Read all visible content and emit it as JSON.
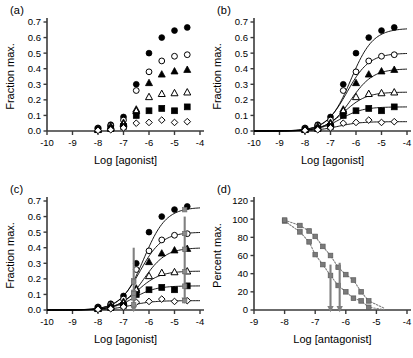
{
  "figure": {
    "panels": [
      "a",
      "b",
      "c",
      "d"
    ]
  },
  "panel_a": {
    "label": "(a)",
    "chart_data": {
      "type": "scatter",
      "title": "",
      "xlabel": "Log [agonist]",
      "ylabel": "Fraction max.",
      "xlim": [
        -10,
        -4
      ],
      "ylim": [
        0.0,
        0.7
      ],
      "xticks": [
        -10,
        -9,
        -8,
        -7,
        -6,
        -5,
        -4
      ],
      "xticklabels": [
        "-10",
        "-9",
        "-8",
        "-7",
        "-6",
        "-5",
        "-4"
      ],
      "yticks": [
        0.0,
        0.1,
        0.2,
        0.3,
        0.4,
        0.5,
        0.6,
        0.7
      ],
      "yticklabels": [
        "0.0",
        "0.1",
        "0.2",
        "0.3",
        "0.4",
        "0.5",
        "0.6",
        "0.7"
      ],
      "grid": false,
      "legend": "none",
      "x": [
        -8.0,
        -7.5,
        -7.0,
        -6.5,
        -6.0,
        -5.5,
        -5.0,
        -4.5
      ],
      "series": [
        {
          "name": "filled-circle",
          "marker": "filled-circle",
          "values": [
            0.02,
            0.04,
            0.09,
            0.3,
            0.5,
            0.6,
            0.645,
            0.665
          ]
        },
        {
          "name": "open-circle",
          "marker": "open-circle",
          "values": [
            0.015,
            0.035,
            0.07,
            0.26,
            0.38,
            0.45,
            0.48,
            0.49
          ]
        },
        {
          "name": "filled-triangle",
          "marker": "filled-triangle",
          "values": [
            0.012,
            0.03,
            0.055,
            0.14,
            0.31,
            0.365,
            0.385,
            0.395
          ]
        },
        {
          "name": "open-triangle",
          "marker": "open-triangle",
          "values": [
            0.01,
            0.02,
            0.045,
            0.13,
            0.22,
            0.24,
            0.245,
            0.25
          ]
        },
        {
          "name": "filled-square",
          "marker": "filled-square",
          "values": [
            0.008,
            0.015,
            0.03,
            0.1,
            0.13,
            0.145,
            0.13,
            0.155
          ]
        },
        {
          "name": "open-diamond",
          "marker": "open-diamond",
          "values": [
            0.004,
            0.008,
            0.02,
            0.05,
            0.055,
            0.07,
            0.055,
            0.06
          ]
        }
      ]
    }
  },
  "panel_b": {
    "label": "(b)",
    "chart_data": {
      "type": "line",
      "title": "",
      "xlabel": "Log [agonist]",
      "ylabel": "Fraction max.",
      "xlim": [
        -10,
        -4
      ],
      "ylim": [
        0.0,
        0.7
      ],
      "xticks": [
        -10,
        -9,
        -8,
        -7,
        -6,
        -5,
        -4
      ],
      "xticklabels": [
        "-10",
        "-9",
        "-8",
        "-7",
        "-6",
        "-5",
        "-4"
      ],
      "yticks": [
        0.0,
        0.1,
        0.2,
        0.3,
        0.4,
        0.5,
        0.6,
        0.7
      ],
      "yticklabels": [
        "0.0",
        "0.1",
        "0.2",
        "0.3",
        "0.4",
        "0.5",
        "0.6",
        "0.7"
      ],
      "grid": false,
      "legend": "none",
      "note": "Same data as panel (a) with fitted sigmoid curves overlaid",
      "x": [
        -8.0,
        -7.5,
        -7.0,
        -6.5,
        -6.0,
        -5.5,
        -5.0,
        -4.5
      ],
      "series": [
        {
          "name": "filled-circle",
          "marker": "filled-circle",
          "values": [
            0.02,
            0.04,
            0.09,
            0.3,
            0.5,
            0.6,
            0.645,
            0.665
          ],
          "fit": {
            "top": 0.66,
            "ec50_log": -6.2,
            "hill": 1.0
          }
        },
        {
          "name": "open-circle",
          "marker": "open-circle",
          "values": [
            0.015,
            0.035,
            0.07,
            0.26,
            0.38,
            0.45,
            0.48,
            0.49
          ],
          "fit": {
            "top": 0.5,
            "ec50_log": -6.35,
            "hill": 1.0
          }
        },
        {
          "name": "filled-triangle",
          "marker": "filled-triangle",
          "values": [
            0.012,
            0.03,
            0.055,
            0.14,
            0.31,
            0.365,
            0.385,
            0.395
          ],
          "fit": {
            "top": 0.4,
            "ec50_log": -6.2,
            "hill": 1.0
          }
        },
        {
          "name": "open-triangle",
          "marker": "open-triangle",
          "values": [
            0.01,
            0.02,
            0.045,
            0.13,
            0.22,
            0.24,
            0.245,
            0.25
          ],
          "fit": {
            "top": 0.25,
            "ec50_log": -6.45,
            "hill": 1.0
          }
        },
        {
          "name": "filled-square",
          "marker": "filled-square",
          "values": [
            0.008,
            0.015,
            0.03,
            0.1,
            0.13,
            0.145,
            0.13,
            0.155
          ],
          "fit": {
            "top": 0.155,
            "ec50_log": -6.6,
            "hill": 1.0
          }
        },
        {
          "name": "open-diamond",
          "marker": "open-diamond",
          "values": [
            0.004,
            0.008,
            0.02,
            0.05,
            0.055,
            0.07,
            0.055,
            0.06
          ],
          "fit": {
            "top": 0.06,
            "ec50_log": -6.7,
            "hill": 1.0
          }
        }
      ]
    }
  },
  "panel_c": {
    "label": "(c)",
    "chart_data": {
      "type": "line",
      "title": "",
      "xlabel": "Log [agonist]",
      "ylabel": "Fraction max.",
      "xlim": [
        -10,
        -4
      ],
      "ylim": [
        0.0,
        0.7
      ],
      "xticks": [
        -10,
        -9,
        -8,
        -7,
        -6,
        -5,
        -4
      ],
      "xticklabels": [
        "-10",
        "-9",
        "-8",
        "-7",
        "-6",
        "-5",
        "-4"
      ],
      "yticks": [
        0.0,
        0.1,
        0.2,
        0.3,
        0.4,
        0.5,
        0.6,
        0.7
      ],
      "yticklabels": [
        "0.0",
        "0.1",
        "0.2",
        "0.3",
        "0.4",
        "0.5",
        "0.6",
        "0.7"
      ],
      "grid": false,
      "legend": "none",
      "note": "Same fitted curves as (b) with two vertical gray readout arrows",
      "x": [
        -8.0,
        -7.5,
        -7.0,
        -6.5,
        -6.0,
        -5.5,
        -5.0,
        -4.5
      ],
      "series": [
        {
          "name": "filled-circle",
          "marker": "filled-circle",
          "values": [
            0.02,
            0.04,
            0.09,
            0.3,
            0.5,
            0.6,
            0.645,
            0.665
          ],
          "fit": {
            "top": 0.66,
            "ec50_log": -6.2,
            "hill": 1.0
          }
        },
        {
          "name": "open-circle",
          "marker": "open-circle",
          "values": [
            0.015,
            0.035,
            0.07,
            0.26,
            0.38,
            0.45,
            0.48,
            0.49
          ],
          "fit": {
            "top": 0.5,
            "ec50_log": -6.35,
            "hill": 1.0
          }
        },
        {
          "name": "filled-triangle",
          "marker": "filled-triangle",
          "values": [
            0.012,
            0.03,
            0.055,
            0.14,
            0.31,
            0.365,
            0.385,
            0.395
          ],
          "fit": {
            "top": 0.4,
            "ec50_log": -6.2,
            "hill": 1.0
          }
        },
        {
          "name": "open-triangle",
          "marker": "open-triangle",
          "values": [
            0.01,
            0.02,
            0.045,
            0.13,
            0.22,
            0.24,
            0.245,
            0.25
          ],
          "fit": {
            "top": 0.25,
            "ec50_log": -6.45,
            "hill": 1.0
          }
        },
        {
          "name": "filled-square",
          "marker": "filled-square",
          "values": [
            0.008,
            0.015,
            0.03,
            0.1,
            0.13,
            0.145,
            0.13,
            0.155
          ],
          "fit": {
            "top": 0.155,
            "ec50_log": -6.6,
            "hill": 1.0
          }
        },
        {
          "name": "open-diamond",
          "marker": "open-diamond",
          "values": [
            0.004,
            0.008,
            0.02,
            0.05,
            0.055,
            0.07,
            0.055,
            0.06
          ],
          "fit": {
            "top": 0.06,
            "ec50_log": -6.7,
            "hill": 1.0
          }
        }
      ],
      "arrows": [
        {
          "name": "arrow-low-dose",
          "x": -6.6,
          "y_from": 0.4,
          "y_to": 0.0,
          "color": "#808080"
        },
        {
          "name": "arrow-high-dose",
          "x": -4.6,
          "y_from": 0.6,
          "y_to": 0.055,
          "color": "#808080"
        }
      ]
    }
  },
  "panel_d": {
    "label": "(d)",
    "chart_data": {
      "type": "line",
      "title": "",
      "xlabel": "Log [antagonist]",
      "ylabel": "Percent max.",
      "xlim": [
        -9,
        -4
      ],
      "ylim": [
        0,
        120
      ],
      "xticks": [
        -9,
        -8,
        -7,
        -6,
        -5,
        -4
      ],
      "xticklabels": [
        "-9",
        "-8",
        "-7",
        "-6",
        "-5",
        "-4"
      ],
      "yticks": [
        0,
        20,
        40,
        60,
        80,
        100,
        120
      ],
      "yticklabels": [
        "0",
        "20",
        "40",
        "60",
        "80",
        "100",
        "120"
      ],
      "grid": false,
      "legend": "none",
      "x": [
        -8.0,
        -7.5,
        -7.2,
        -7.0,
        -6.75,
        -6.5,
        -6.25,
        -6.0,
        -5.75,
        -5.5,
        -5.25
      ],
      "series": [
        {
          "name": "inhibition-curve-left",
          "marker": "filled-square-gray",
          "color": "#808080",
          "style": "dotted",
          "values": [
            98,
            86,
            75,
            61,
            50,
            38,
            27,
            20,
            13,
            10,
            3
          ]
        },
        {
          "name": "inhibition-curve-right",
          "marker": "filled-square-gray",
          "color": "#808080",
          "style": "dotted",
          "values": [
            99,
            93,
            87,
            81,
            70,
            60,
            47,
            39,
            33,
            20,
            10
          ]
        }
      ],
      "arrows": [
        {
          "name": "arrow-ic50-left",
          "x": -6.5,
          "y_from": 50,
          "y_to": 0,
          "color": "#808080"
        },
        {
          "name": "arrow-ic50-right",
          "x": -6.2,
          "y_from": 52,
          "y_to": 0,
          "color": "#808080"
        }
      ]
    }
  }
}
